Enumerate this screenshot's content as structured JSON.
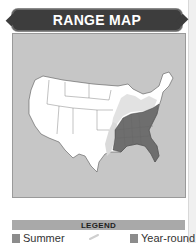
{
  "header": {
    "title": "RANGE MAP"
  },
  "map": {
    "region": "Contiguous United States",
    "background_color": "#c6c6c6",
    "land_color": "#ffffff",
    "summer_color": "#d9d9d9",
    "year_round_color": "#6e6e6e"
  },
  "legend": {
    "title": "LEGEND",
    "items": [
      {
        "label": "Summer",
        "color": "#8c8c8c",
        "icon": "summer-swatch"
      },
      {
        "label": "Year-round",
        "color": "#8c8c8c",
        "icon": "year-round-swatch"
      }
    ],
    "decor_icon": "feather-icon"
  }
}
